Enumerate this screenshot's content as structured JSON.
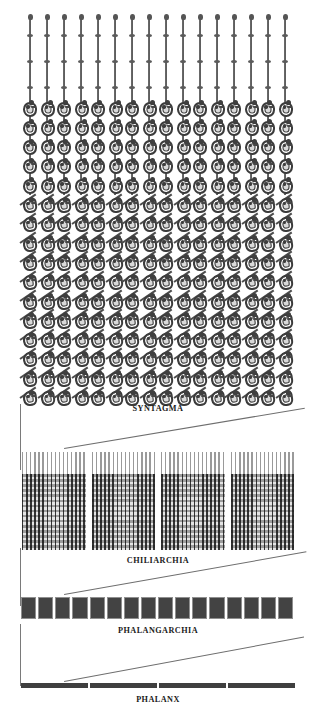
{
  "diagram": {
    "background_color": "#ffffff",
    "ink_color": "#3f3f3f",
    "rule_color": "#6e6e6e"
  },
  "levels": [
    {
      "key": "syntagma",
      "label": "SYNTAGMA",
      "files": 16,
      "ranks": 16,
      "front_ranks_with_vertical_pikes": 5,
      "rear_ranks_with_raised_pikes": 11,
      "unit_count": 1,
      "men": 256
    },
    {
      "key": "chiliarchia",
      "label": "CHILIARCHIA",
      "blocks": 4,
      "men": 1024
    },
    {
      "key": "phalangarchia",
      "label": "PHALANGARCHIA",
      "blocks": 16,
      "men": 4096
    },
    {
      "key": "phalanx",
      "label": "PHALANX",
      "segments": 4,
      "men": 16384
    }
  ],
  "labels": {
    "syntagma": "SYNTAGMA",
    "chiliarchia": "CHILIARCHIA",
    "phalangarchia": "PHALANGARCHIA",
    "phalanx": "PHALANX"
  },
  "icons": {
    "soldier": "hoplite-with-shield-icon",
    "pike": "sarissa-pike-icon"
  }
}
